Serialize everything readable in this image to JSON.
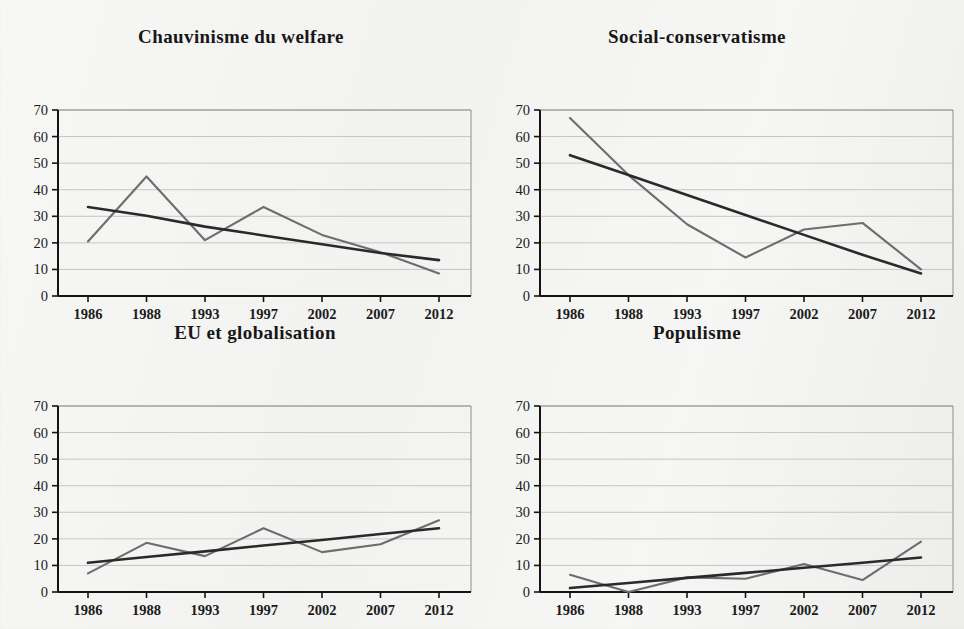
{
  "figure": {
    "background_color": "#f4f4f3",
    "data_line_color": "#6d6d6d",
    "trend_line_color": "#2a2a2a",
    "grid_color": "#b9b9b9"
  },
  "panels": [
    {
      "title": "Chauvinisme du welfare"
    },
    {
      "title": "Social-conservatisme"
    },
    {
      "title": "EU et globalisation"
    },
    {
      "title": "Populisme"
    }
  ],
  "axis": {
    "y_ticks": [
      "70",
      "60",
      "50",
      "40",
      "30",
      "20",
      "10",
      "0"
    ],
    "x_ticks": [
      "1986",
      "1988",
      "1993",
      "1997",
      "2002",
      "2007",
      "2012"
    ]
  },
  "chart_data": [
    {
      "type": "line",
      "title": "Chauvinisme du welfare",
      "xlabel": "",
      "ylabel": "",
      "ylim": [
        0,
        70
      ],
      "ytick_step": 10,
      "grid": true,
      "legend": "none",
      "categories": [
        "1986",
        "1988",
        "1993",
        "1997",
        "2002",
        "2007",
        "2012"
      ],
      "series": [
        {
          "name": "valeurs observees",
          "values": [
            20.5,
            45,
            21,
            33.5,
            23,
            16.5,
            8.5
          ]
        },
        {
          "name": "tendance lineaire",
          "values": [
            33.5,
            30.2,
            26.1,
            22.8,
            19.5,
            16.2,
            13.5
          ]
        }
      ]
    },
    {
      "type": "line",
      "title": "Social-conservatisme",
      "xlabel": "",
      "ylabel": "",
      "ylim": [
        0,
        70
      ],
      "ytick_step": 10,
      "grid": true,
      "legend": "none",
      "categories": [
        "1986",
        "1988",
        "1993",
        "1997",
        "2002",
        "2007",
        "2012"
      ],
      "series": [
        {
          "name": "valeurs observees",
          "values": [
            67,
            45.5,
            27,
            14.5,
            25,
            27.5,
            10
          ]
        },
        {
          "name": "tendance lineaire",
          "values": [
            53,
            45.5,
            38,
            30.5,
            23,
            15.5,
            8.5
          ]
        }
      ]
    },
    {
      "type": "line",
      "title": "EU et globalisation",
      "xlabel": "",
      "ylabel": "",
      "ylim": [
        0,
        70
      ],
      "ytick_step": 10,
      "grid": true,
      "legend": "none",
      "categories": [
        "1986",
        "1988",
        "1993",
        "1997",
        "2002",
        "2007",
        "2012"
      ],
      "series": [
        {
          "name": "valeurs observees",
          "values": [
            7,
            18.5,
            13.5,
            24,
            15,
            18,
            27
          ]
        },
        {
          "name": "tendance lineaire",
          "values": [
            11,
            13.2,
            15.3,
            17.5,
            19.6,
            21.8,
            24
          ]
        }
      ]
    },
    {
      "type": "line",
      "title": "Populisme",
      "xlabel": "",
      "ylabel": "",
      "ylim": [
        0,
        70
      ],
      "ytick_step": 10,
      "grid": true,
      "legend": "none",
      "categories": [
        "1986",
        "1988",
        "1993",
        "1997",
        "2002",
        "2007",
        "2012"
      ],
      "series": [
        {
          "name": "valeurs observees",
          "values": [
            6.5,
            0,
            5.5,
            5,
            10.5,
            4.5,
            19
          ]
        },
        {
          "name": "tendance lineaire",
          "values": [
            1.5,
            3.4,
            5.3,
            7.2,
            9.1,
            11,
            13
          ]
        }
      ]
    }
  ]
}
